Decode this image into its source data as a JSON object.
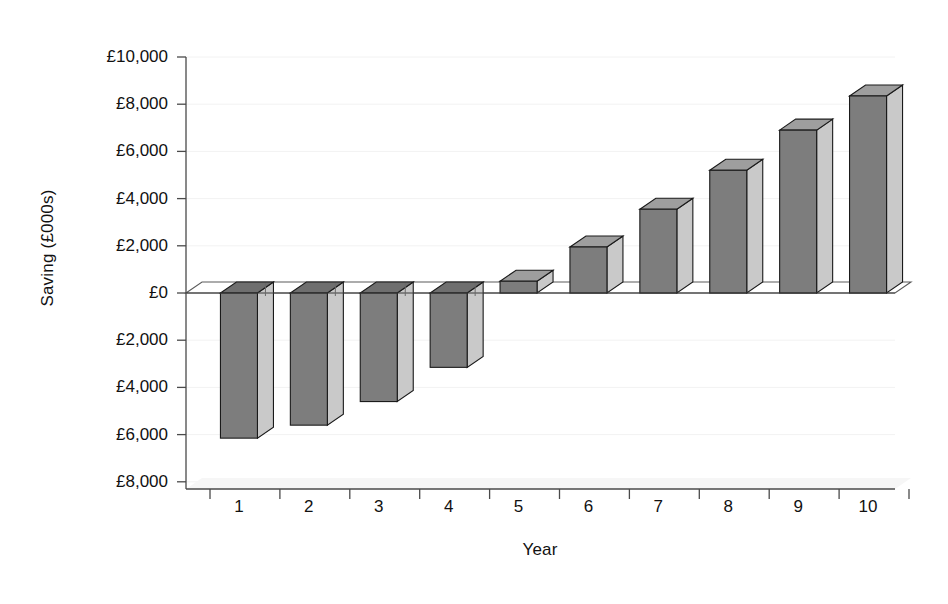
{
  "chart_data": {
    "type": "bar",
    "title": "",
    "xlabel": "Year",
    "ylabel": "Saving (£000s)",
    "categories": [
      "1",
      "2",
      "3",
      "4",
      "5",
      "6",
      "7",
      "8",
      "9",
      "10"
    ],
    "values": [
      -6150,
      -5600,
      -4600,
      -3150,
      500,
      1950,
      3550,
      5200,
      6900,
      8350
    ],
    "ylim": [
      -8000,
      10000
    ],
    "ytick_values": [
      10000,
      8000,
      6000,
      4000,
      2000,
      0,
      -2000,
      -4000,
      -6000,
      -8000
    ],
    "ytick_labels": [
      "£10,000",
      "£8,000",
      "£6,000",
      "£4,000",
      "£2,000",
      "£0",
      "£2,000",
      "£4,000",
      "£6,000",
      "£8,000"
    ],
    "grid": false,
    "legend": false,
    "style": "3d-column",
    "bar_front_color": "#7d7d7d",
    "bar_side_color": "#c9c9c9",
    "bar_top_color": "#a5a5a5",
    "bar_outline_color": "#1a1a1a",
    "axis_color": "#4a4a4a",
    "background_color": "#ffffff"
  },
  "axes": {
    "y_title": "Saving (£000s)",
    "x_title": "Year"
  }
}
